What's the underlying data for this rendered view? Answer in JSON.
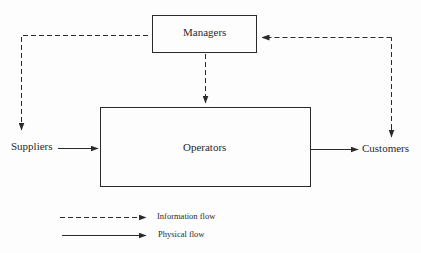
{
  "diagram": {
    "nodes": {
      "managers": {
        "label": "Managers"
      },
      "operators": {
        "label": "Operators"
      },
      "suppliers": {
        "label": "Suppliers"
      },
      "customers": {
        "label": "Customers"
      }
    },
    "edges": [
      {
        "from": "managers",
        "to": "suppliers",
        "type": "information"
      },
      {
        "from": "customers",
        "to": "managers",
        "type": "information"
      },
      {
        "from": "managers",
        "to": "operators",
        "type": "information"
      },
      {
        "from": "suppliers",
        "to": "operators",
        "type": "physical"
      },
      {
        "from": "operators",
        "to": "customers",
        "type": "physical"
      }
    ],
    "legend": {
      "information": "Information flow",
      "physical": "Physical flow"
    },
    "colors": {
      "line": "#2a2a2a",
      "background": "#fdfdfd"
    }
  }
}
